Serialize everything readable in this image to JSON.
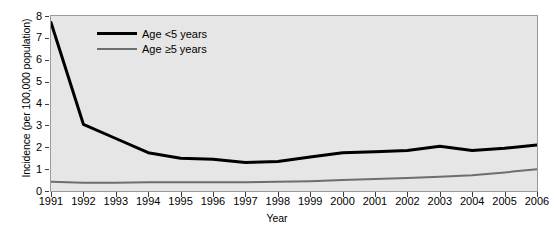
{
  "chart_data": {
    "type": "line",
    "title": "",
    "xlabel": "Year",
    "ylabel": "Incidence (per 100,000 population)",
    "x": [
      1991,
      1992,
      1993,
      1994,
      1995,
      1996,
      1997,
      1998,
      1999,
      2000,
      2001,
      2002,
      2003,
      2004,
      2005,
      2006
    ],
    "categories": [
      "1991",
      "1992",
      "1993",
      "1994",
      "1995",
      "1996",
      "1997",
      "1998",
      "1999",
      "2000",
      "2001",
      "2002",
      "2003",
      "2004",
      "2005",
      "2006"
    ],
    "xlim": [
      1991,
      2006
    ],
    "ylim": [
      0,
      8
    ],
    "yticks": [
      0,
      1,
      2,
      3,
      4,
      5,
      6,
      7,
      8
    ],
    "ytick_labels": [
      "0",
      "1",
      "2",
      "3",
      "4",
      "5",
      "6",
      "7",
      "8"
    ],
    "grid": false,
    "legend_position": "top-left-inside",
    "series": [
      {
        "name": "Age <5 years",
        "color": "#000000",
        "width": 3,
        "values": [
          7.7,
          3.05,
          2.4,
          1.75,
          1.5,
          1.45,
          1.3,
          1.35,
          1.55,
          1.75,
          1.8,
          1.85,
          2.05,
          1.85,
          1.95,
          2.1
        ]
      },
      {
        "name": "Age ≥5 years",
        "color": "#6e6e6e",
        "width": 2,
        "values": [
          0.42,
          0.38,
          0.38,
          0.4,
          0.4,
          0.4,
          0.4,
          0.42,
          0.45,
          0.5,
          0.55,
          0.6,
          0.65,
          0.72,
          0.85,
          1.0
        ]
      }
    ]
  },
  "legend": {
    "items": [
      {
        "label": "Age <5 years"
      },
      {
        "label": "Age ≥5 years"
      }
    ]
  },
  "axes": {
    "x_title": "Year",
    "y_title": "Incidence (per 100,000 population)"
  },
  "colors": {
    "plot_background": "#e6e6e6",
    "page_background": "#ffffff",
    "frame": "#9a9a9a",
    "series_under5": "#000000",
    "series_over5": "#6e6e6e",
    "text": "#000000"
  }
}
